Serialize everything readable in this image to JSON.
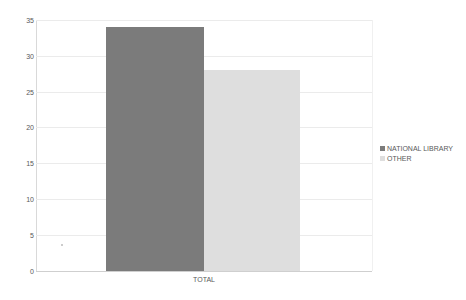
{
  "chart_data": {
    "type": "bar",
    "title": "",
    "xlabel": "",
    "ylabel": "",
    "categories": [
      "TOTAL"
    ],
    "series": [
      {
        "name": "NATIONAL LIBRARY",
        "values": [
          34
        ],
        "color": "#7b7b7b"
      },
      {
        "name": "OTHER",
        "values": [
          28
        ],
        "color": "#dedede"
      }
    ],
    "ylim": [
      0,
      35
    ],
    "yticks": [
      "0",
      "5",
      "10",
      "15",
      "20",
      "25",
      "30",
      "35"
    ],
    "grid": true,
    "legend_position": "right"
  }
}
